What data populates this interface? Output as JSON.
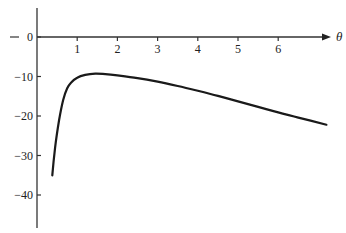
{
  "chart_data": {
    "type": "line",
    "title": "",
    "xlabel": "θ",
    "ylabel": "",
    "xlim": [
      0,
      7.3
    ],
    "ylim": [
      -47,
      8
    ],
    "grid": false,
    "legend": null,
    "x_ticks": [
      1,
      2,
      3,
      4,
      5,
      6
    ],
    "x_tick_labels": [
      "1",
      "2",
      "3",
      "4",
      "5",
      "6"
    ],
    "y_ticks": [
      0,
      -10,
      -20,
      -30,
      -40
    ],
    "y_tick_labels": [
      "0",
      "−10",
      "−20",
      "−30",
      "−40"
    ],
    "series": [
      {
        "name": "curve",
        "color": "#1a1a1a",
        "x": [
          0.38,
          0.45,
          0.55,
          0.65,
          0.75,
          0.85,
          1.0,
          1.2,
          1.45,
          1.7,
          2.0,
          2.5,
          3.0,
          3.5,
          4.0,
          4.5,
          5.0,
          5.5,
          6.0,
          6.5,
          7.2
        ],
        "y": [
          -35,
          -28,
          -21,
          -16,
          -13,
          -11.5,
          -10.3,
          -9.6,
          -9.3,
          -9.4,
          -9.7,
          -10.4,
          -11.3,
          -12.4,
          -13.6,
          -14.9,
          -16.3,
          -17.7,
          -19.1,
          -20.4,
          -22.2
        ]
      }
    ]
  }
}
